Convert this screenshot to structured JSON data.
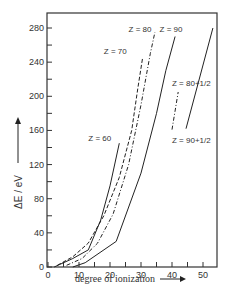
{
  "chart_data": {
    "type": "line",
    "title": "",
    "xlabel": "degree of ionization",
    "ylabel": "ΔE / eV",
    "xlim": [
      0,
      55
    ],
    "ylim": [
      0,
      295
    ],
    "xticks": [
      0,
      10,
      20,
      30,
      40,
      50
    ],
    "xminorticks": [
      5,
      15,
      25,
      35,
      45
    ],
    "yticks": [
      0,
      40,
      80,
      120,
      160,
      200,
      240,
      280
    ],
    "yminorticks": [
      20,
      60,
      100,
      140,
      180,
      220,
      260
    ],
    "grid": false,
    "legend": "inline labels",
    "series": [
      {
        "name": "Z = 60",
        "style": "solid",
        "label_pos": [
          13,
          148
        ],
        "x": [
          2,
          8,
          13,
          17,
          20,
          23
        ],
        "y": [
          0,
          10,
          20,
          55,
          95,
          145
        ]
      },
      {
        "name": "Z = 70",
        "style": "dashed",
        "label_pos": [
          18,
          250
        ],
        "x": [
          3,
          8,
          13,
          18,
          23,
          27,
          29,
          30.5
        ],
        "y": [
          2,
          12,
          28,
          60,
          105,
          160,
          210,
          245
        ]
      },
      {
        "name": "Z = 80",
        "style": "dashdot",
        "label_pos": [
          26,
          275
        ],
        "x": [
          6,
          11,
          16,
          21,
          26,
          30,
          33,
          34.5
        ],
        "y": [
          2,
          10,
          28,
          62,
          120,
          190,
          250,
          275
        ]
      },
      {
        "name": "Z = 90",
        "style": "solid",
        "label_pos": [
          36,
          275
        ],
        "x": [
          8,
          12,
          22,
          30,
          35,
          38,
          41
        ],
        "y": [
          0,
          5,
          30,
          110,
          180,
          230,
          270
        ]
      },
      {
        "name": "Z = 80+1/2",
        "style": "dashdot",
        "label_pos": [
          40,
          212
        ],
        "x": [
          40,
          42
        ],
        "y": [
          161,
          205
        ]
      },
      {
        "name": "Z = 90+1/2",
        "style": "solid",
        "label_pos": [
          40,
          145
        ],
        "x": [
          44.5,
          53.2
        ],
        "y": [
          162,
          280
        ]
      }
    ]
  }
}
